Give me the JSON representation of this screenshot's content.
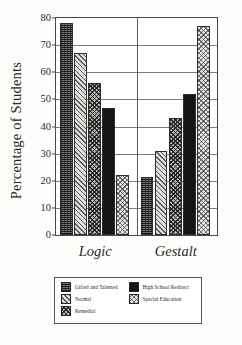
{
  "chart_data": {
    "type": "bar",
    "title": "",
    "xlabel": "",
    "ylabel": "Percentage of Students",
    "categories": [
      "Logic",
      "Gestalt"
    ],
    "ylim": [
      0,
      80
    ],
    "yticks": [
      0,
      10,
      20,
      30,
      40,
      50,
      60,
      70,
      80
    ],
    "ytick_labels": [
      "0",
      "10",
      "20",
      "30",
      "40",
      "50",
      "60",
      "70",
      "80"
    ],
    "grid": true,
    "grid_axis": "y",
    "legend_position": "bottom",
    "series": [
      {
        "name": "Gifted and Talented",
        "values": [
          78,
          21.5
        ],
        "pattern": "dense-dark-stipple",
        "color": "#7c7c78"
      },
      {
        "name": "Normal",
        "values": [
          67,
          31
        ],
        "pattern": "diagonal-hatch",
        "color": "#dededa"
      },
      {
        "name": "Remedial",
        "values": [
          56,
          43
        ],
        "pattern": "crosshatch-dark",
        "color": "#b4b4b0"
      },
      {
        "name": "High School Redirect",
        "values": [
          47,
          52
        ],
        "pattern": "solid-black",
        "color": "#151514"
      },
      {
        "name": "Special Education",
        "values": [
          22,
          77
        ],
        "pattern": "crosshatch-light",
        "color": "#e6e6e2"
      }
    ]
  },
  "legend": {
    "entries": [
      {
        "label": "Gifted and Talented"
      },
      {
        "label": "High School Redirect"
      },
      {
        "label": "Normal"
      },
      {
        "label": "Special Education"
      },
      {
        "label": "Remedial"
      }
    ]
  }
}
